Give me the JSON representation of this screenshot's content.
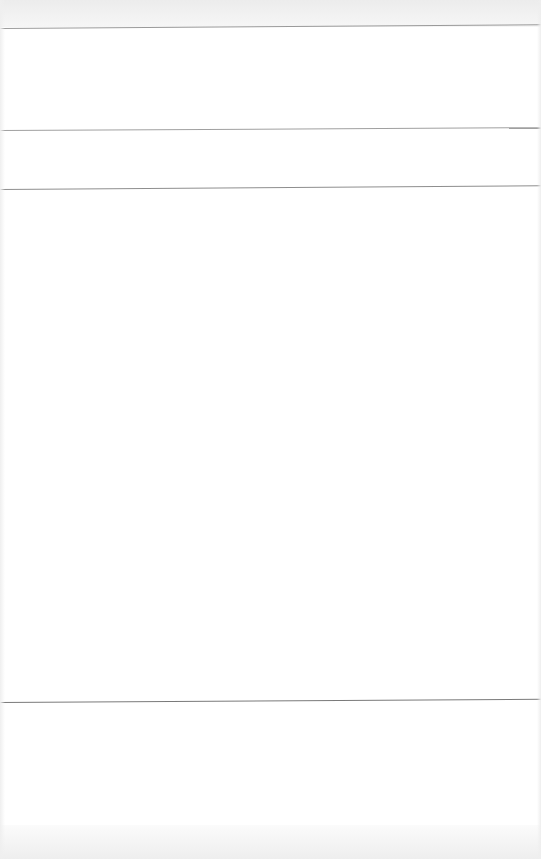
{
  "page": {
    "background": "#ffffff",
    "width": 541,
    "height": 859
  },
  "bands": {
    "top": {
      "color": "#ececec",
      "height": 27
    },
    "bottom": {
      "color": "#eeeeee",
      "height": 34
    }
  },
  "dividers": [
    {
      "y": 28,
      "color": "#9a9a9a",
      "tilt_deg": -0.4
    },
    {
      "y": 130,
      "color": "#a0a0a0",
      "tilt_deg": -0.3
    },
    {
      "y": 189,
      "color": "#8e8e8e",
      "tilt_deg": -0.4
    },
    {
      "y": 702,
      "color": "#7a7a7a",
      "tilt_deg": -0.35
    }
  ],
  "sections": [
    {
      "name": "header-section",
      "top": 29,
      "height": 100
    },
    {
      "name": "subheader-section",
      "top": 131,
      "height": 57
    },
    {
      "name": "main-content-section",
      "top": 190,
      "height": 511
    },
    {
      "name": "footer-section",
      "top": 703,
      "height": 122
    }
  ]
}
